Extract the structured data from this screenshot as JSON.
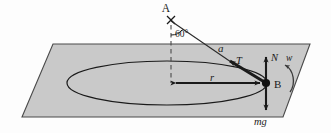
{
  "figure": {
    "kind": "physics-force-diagram",
    "background_color": "#fdfdfd",
    "plane_fill": "#c9c9c9",
    "plane_stroke": "#4a4a4a",
    "stroke_color": "#1a1a1a"
  },
  "labels": {
    "point_a": "A",
    "point_b": "B",
    "angle": "60°",
    "string_upper": "a",
    "tension": "T",
    "normal": "N",
    "weight": "mg",
    "angular_velocity": "w",
    "radius": "r"
  },
  "geometry": {
    "plane_corners": "53,44 310,44 283,117 22,117",
    "ellipse": {
      "cx": 167,
      "cy": 83,
      "rx": 100,
      "ry": 22
    },
    "apex": {
      "x": 171,
      "y": 20
    },
    "mass_point": {
      "x": 266,
      "y": 83
    },
    "dashed_axis": {
      "x": 171,
      "y1": 25,
      "y2": 83
    },
    "normal_arrow": {
      "x": 266,
      "y1": 83,
      "y2": 56
    },
    "weight_arrow": {
      "x": 266,
      "y1": 83,
      "y2": 110
    },
    "radius_arrow": {
      "y": 83,
      "x1": 172,
      "x2": 264
    }
  },
  "label_positions": {
    "point_a": {
      "x": 166,
      "y": 12
    },
    "angle": {
      "x": 175,
      "y": 34
    },
    "string_upper": {
      "x": 218,
      "y": 50
    },
    "tension": {
      "x": 239,
      "y": 62
    },
    "normal": {
      "x": 272,
      "y": 60
    },
    "angular_velocity": {
      "x": 288,
      "y": 60
    },
    "point_b": {
      "x": 276,
      "y": 87
    },
    "radius": {
      "x": 213,
      "y": 80
    },
    "weight": {
      "x": 261,
      "y": 122
    }
  }
}
